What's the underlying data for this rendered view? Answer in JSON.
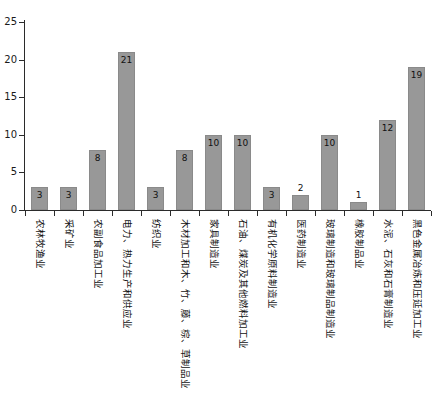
{
  "chart_data": {
    "type": "bar",
    "title": "",
    "subtitle": "",
    "xlabel": "",
    "ylabel": "",
    "ylim": [
      0,
      25
    ],
    "yticks": [
      0,
      5,
      10,
      15,
      20,
      25
    ],
    "grid": false,
    "legend": false,
    "bar_color": "#989898",
    "axis_color": "#2b2b2b",
    "label_color": "#111111",
    "categories": [
      "农林牧渔业",
      "采矿业",
      "农副食品加工业",
      "电力、热力生产和供应业",
      "纺织业",
      "木材加工和木、竹、藤、棕、草制品业",
      "家具制造业",
      "石油、煤炭及其他燃料加工业",
      "有机化学原料制造业",
      "医药制造业",
      "玻璃制造和玻璃制品制造业",
      "橡胶制品业",
      "水泥、石灰和石膏制造业",
      "黑色金属冶炼和压延加工业"
    ],
    "values": [
      3,
      3,
      8,
      21,
      3,
      8,
      10,
      10,
      3,
      2,
      10,
      1,
      12,
      19
    ],
    "value_labels": [
      "3",
      "3",
      "8",
      "21",
      "3",
      "8",
      "10",
      "10",
      "3",
      "2",
      "10",
      "1",
      "12",
      "19"
    ]
  }
}
